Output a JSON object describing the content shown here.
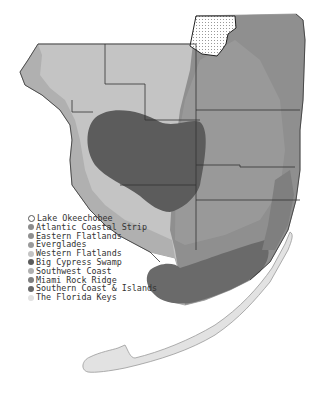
{
  "map": {
    "title": "Physiographic regions of South Florida",
    "colors": {
      "background": "#ffffff",
      "lake_okeechobee": "#ffffff",
      "atlantic_coastal_strip": "#8c8c8c",
      "eastern_flatlands": "#8f8f8f",
      "everglades": "#9a9a9a",
      "western_flatlands": "#c4c4c4",
      "big_cypress_swamp": "#5c5c5c",
      "southwest_coast": "#b0b0b0",
      "miami_rock_ridge": "#7f7f7f",
      "southern_coast_islands": "#6a6a6a",
      "florida_keys": "#e2e2e2",
      "county_lines": "#333333"
    }
  },
  "legend": {
    "items": [
      {
        "label": "Lake Okeechobee",
        "color": "#ffffff",
        "marker": "outline"
      },
      {
        "label": "Atlantic Coastal Strip",
        "color": "#8c8c8c",
        "marker": "dot"
      },
      {
        "label": "Eastern Flatlands",
        "color": "#8f8f8f",
        "marker": "dot"
      },
      {
        "label": "Everglades",
        "color": "#9a9a9a",
        "marker": "dot"
      },
      {
        "label": "Western Flatlands",
        "color": "#c4c4c4",
        "marker": "dot"
      },
      {
        "label": "Big Cypress Swamp",
        "color": "#5c5c5c",
        "marker": "dot"
      },
      {
        "label": "Southwest Coast",
        "color": "#b0b0b0",
        "marker": "dot"
      },
      {
        "label": "Miami Rock Ridge",
        "color": "#7f7f7f",
        "marker": "dot"
      },
      {
        "label": "Southern Coast & Islands",
        "color": "#6a6a6a",
        "marker": "dot"
      },
      {
        "label": "The Florida Keys",
        "color": "#e2e2e2",
        "marker": "dot"
      }
    ]
  }
}
